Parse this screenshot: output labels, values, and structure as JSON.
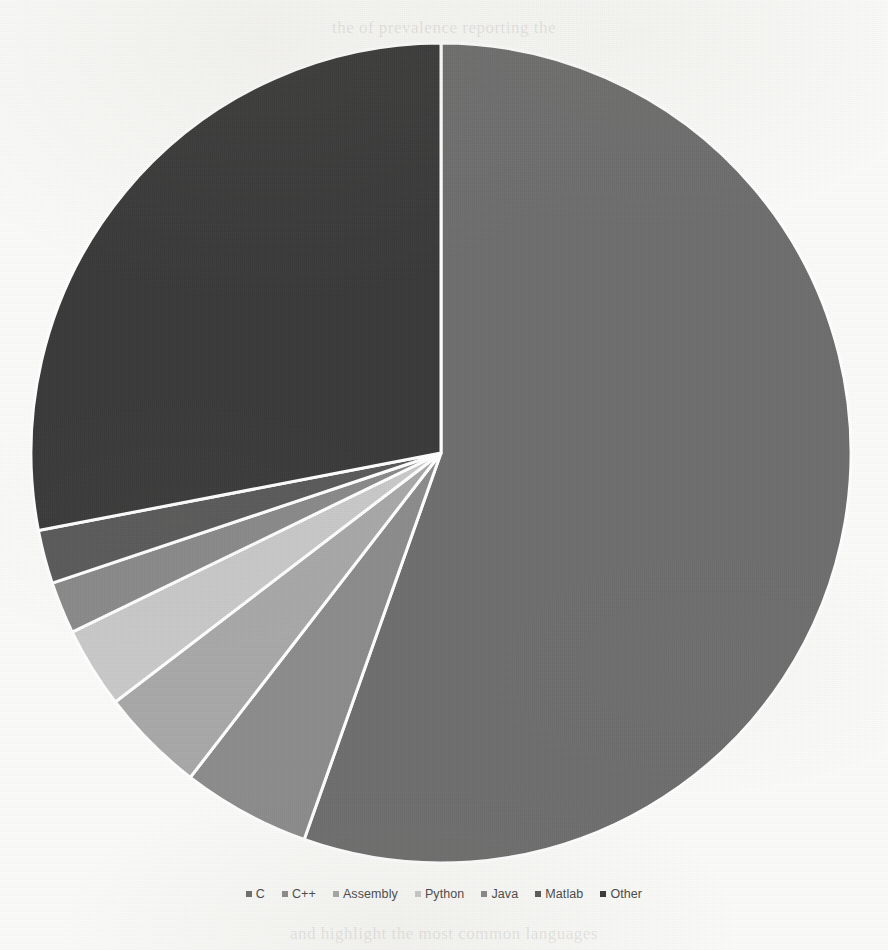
{
  "figure": {
    "background_color": "#fbfbf9",
    "ghost_text_top": "the of prevalence reporting the",
    "ghost_text_bottom": "and highlight the most common languages"
  },
  "chart_data": {
    "type": "pie",
    "title": "",
    "subtitle": "",
    "xlabel": "",
    "ylabel": "",
    "grid": false,
    "legend_position": "bottom",
    "start_angle_deg": 0,
    "direction": "clockwise",
    "center": {
      "x": 441,
      "y": 453
    },
    "radius": 410,
    "slice_border_color": "#ffffff",
    "slice_border_width": 3,
    "categories": [
      "C",
      "C++",
      "Assembly",
      "Python",
      "Java",
      "Matlab",
      "Other"
    ],
    "values": [
      55.4,
      5.1,
      4.1,
      3.2,
      2.1,
      2.1,
      28.0
    ],
    "colors": [
      "#6e6e6e",
      "#8c8c8c",
      "#a8a8a8",
      "#c9c9c9",
      "#8a8a8a",
      "#5a5a5a",
      "#3a3a3a"
    ],
    "slices": [
      {
        "label": "C",
        "value": 55.4,
        "angle_deg": 199.5,
        "color": "#6e6e6e"
      },
      {
        "label": "C++",
        "value": 5.1,
        "angle_deg": 18.2,
        "color": "#8c8c8c"
      },
      {
        "label": "Assembly",
        "value": 4.1,
        "angle_deg": 14.9,
        "color": "#a8a8a8"
      },
      {
        "label": "Python",
        "value": 3.2,
        "angle_deg": 11.5,
        "color": "#c9c9c9"
      },
      {
        "label": "Java",
        "value": 2.1,
        "angle_deg": 7.4,
        "color": "#8a8a8a"
      },
      {
        "label": "Matlab",
        "value": 2.1,
        "angle_deg": 7.6,
        "color": "#5a5a5a"
      },
      {
        "label": "Other",
        "value": 28.0,
        "angle_deg": 100.9,
        "color": "#3a3a3a"
      }
    ]
  },
  "legend": {
    "items": [
      {
        "label": "C",
        "color": "#6e6e6e"
      },
      {
        "label": "C++",
        "color": "#8c8c8c"
      },
      {
        "label": "Assembly",
        "color": "#a8a8a8"
      },
      {
        "label": "Python",
        "color": "#c9c9c9"
      },
      {
        "label": "Java",
        "color": "#8a8a8a"
      },
      {
        "label": "Matlab",
        "color": "#5a5a5a"
      },
      {
        "label": "Other",
        "color": "#3a3a3a"
      }
    ]
  }
}
